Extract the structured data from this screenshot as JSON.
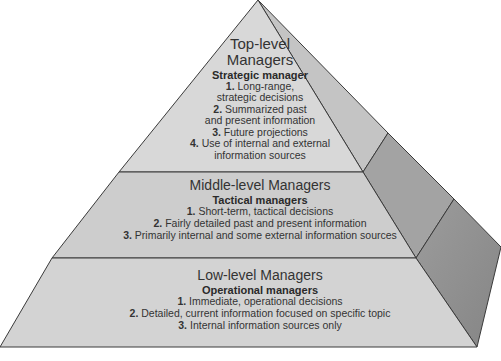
{
  "diagram": {
    "type": "pyramid",
    "colors": {
      "face_light": "#d4d4d4",
      "face_mid": "#c8c8c8",
      "side_top": "#bdbdbd",
      "side_mid": "#9a9a9a",
      "side_low": "#8a8a8a",
      "outline": "#3a3a3a"
    },
    "tiers": [
      {
        "title_line1": "Top-level",
        "title_line2": "Managers",
        "subtitle": "Strategic manager",
        "items": [
          {
            "num": "1.",
            "text_line1": "Long-range,",
            "text_line2": "strategic decisions"
          },
          {
            "num": "2.",
            "text_line1": "Summarized past",
            "text_line2": "and present information"
          },
          {
            "num": "3.",
            "text_line1": "Future projections"
          },
          {
            "num": "4.",
            "text_line1": "Use of internal and external",
            "text_line2": "information sources"
          }
        ]
      },
      {
        "title": "Middle-level Managers",
        "subtitle": "Tactical managers",
        "items": [
          {
            "num": "1.",
            "text": "Short-term, tactical decisions"
          },
          {
            "num": "2.",
            "text": "Fairly detailed past and present information"
          },
          {
            "num": "3.",
            "text": "Primarily internal and some external information sources"
          }
        ]
      },
      {
        "title": "Low-level Managers",
        "subtitle": "Operational managers",
        "items": [
          {
            "num": "1.",
            "text": "Immediate, operational decisions"
          },
          {
            "num": "2.",
            "text": "Detailed, current information focused on specific topic"
          },
          {
            "num": "3.",
            "text": "Internal information sources only"
          }
        ]
      }
    ]
  }
}
